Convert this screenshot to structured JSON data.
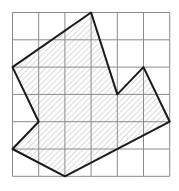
{
  "diagram": {
    "type": "grid-polygon",
    "grid": {
      "columns": 6,
      "rows": 6,
      "origin_px": [
        12.5,
        12.5
      ],
      "cell_w_px": 26.2,
      "cell_h_px": 27.3,
      "line_color": "#8a8a8a"
    },
    "polygon": {
      "vertices_grid": [
        [
          0,
          2
        ],
        [
          3,
          0
        ],
        [
          4,
          3
        ],
        [
          5,
          2
        ],
        [
          6,
          4
        ],
        [
          2,
          6
        ],
        [
          0,
          5
        ],
        [
          1,
          4
        ]
      ],
      "stroke_color": "#1a1a1a",
      "hatch_color": "#b8b8b8",
      "fill": "diagonal-hatch"
    }
  }
}
